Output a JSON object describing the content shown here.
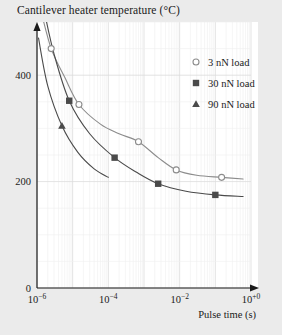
{
  "chart_data": {
    "type": "line",
    "title": "Cantilever heater temperature (°C)",
    "xlabel": "Pulse time (s)",
    "ylabel": "Cantilever heater temperature (°C)",
    "xscale": "log",
    "yscale": "linear",
    "xlim": [
      1e-06,
      1.0
    ],
    "ylim": [
      0,
      500
    ],
    "grid": true,
    "legend_position": "top-right",
    "xticks": [
      {
        "value": 1e-06,
        "label": "10",
        "exp": "−6"
      },
      {
        "value": 0.0001,
        "label": "10",
        "exp": "−4"
      },
      {
        "value": 0.01,
        "label": "10",
        "exp": "−2"
      },
      {
        "value": 1.0,
        "label": "10",
        "exp": "+0"
      }
    ],
    "yticks": [
      {
        "value": 0,
        "label": "0"
      },
      {
        "value": 200,
        "label": "200"
      },
      {
        "value": 400,
        "label": "400"
      }
    ],
    "series": [
      {
        "name": "3 nN load",
        "legend_label": "3 nN load",
        "marker": "open-circle",
        "color": "#8c8c8c",
        "points": [
          {
            "x": 2.5e-06,
            "y": 450
          },
          {
            "x": 1.5e-05,
            "y": 345
          },
          {
            "x": 0.0007,
            "y": 275
          },
          {
            "x": 0.008,
            "y": 222
          },
          {
            "x": 0.15,
            "y": 208
          }
        ],
        "curve": [
          {
            "x": 1.3e-06,
            "y": 520
          },
          {
            "x": 2.5e-06,
            "y": 450
          },
          {
            "x": 6e-06,
            "y": 396
          },
          {
            "x": 1.5e-05,
            "y": 345
          },
          {
            "x": 6e-05,
            "y": 308
          },
          {
            "x": 0.0002,
            "y": 290
          },
          {
            "x": 0.0007,
            "y": 275
          },
          {
            "x": 0.0025,
            "y": 245
          },
          {
            "x": 0.008,
            "y": 222
          },
          {
            "x": 0.03,
            "y": 212
          },
          {
            "x": 0.15,
            "y": 208
          },
          {
            "x": 0.6,
            "y": 205
          }
        ]
      },
      {
        "name": "30 nN load",
        "legend_label": "30 nN load",
        "marker": "filled-square",
        "color": "#4a4a4a",
        "points": [
          {
            "x": 8e-06,
            "y": 352
          },
          {
            "x": 0.00015,
            "y": 245
          },
          {
            "x": 0.0025,
            "y": 196
          },
          {
            "x": 0.1,
            "y": 175
          }
        ],
        "curve": [
          {
            "x": 1.6e-06,
            "y": 520
          },
          {
            "x": 3e-06,
            "y": 440
          },
          {
            "x": 8e-06,
            "y": 352
          },
          {
            "x": 3e-05,
            "y": 290
          },
          {
            "x": 0.00015,
            "y": 245
          },
          {
            "x": 0.0006,
            "y": 218
          },
          {
            "x": 0.0025,
            "y": 196
          },
          {
            "x": 0.015,
            "y": 182
          },
          {
            "x": 0.1,
            "y": 175
          },
          {
            "x": 0.6,
            "y": 172
          }
        ]
      },
      {
        "name": "90 nN load",
        "legend_label": "90 nN load",
        "marker": "filled-triangle",
        "color": "#4a4a4a",
        "points": [
          {
            "x": 5e-06,
            "y": 305
          }
        ],
        "curve": [
          {
            "x": 1.1e-06,
            "y": 470
          },
          {
            "x": 2e-06,
            "y": 380
          },
          {
            "x": 5e-06,
            "y": 305
          },
          {
            "x": 1.4e-05,
            "y": 255
          },
          {
            "x": 4e-05,
            "y": 224
          },
          {
            "x": 0.0001,
            "y": 208
          }
        ]
      }
    ]
  },
  "legend": {
    "entries": [
      {
        "label": "3 nN load",
        "marker": "open-circle",
        "color": "#8c8c8c"
      },
      {
        "label": "30 nN load",
        "marker": "filled-square",
        "color": "#4a4a4a"
      },
      {
        "label": "90 nN load",
        "marker": "filled-triangle",
        "color": "#4a4a4a"
      }
    ]
  },
  "style": {
    "page_background": "#ebebeb",
    "plot_background": "#ffffff",
    "grid_color": "#e3e3e3",
    "axis_color": "#1a1a1a"
  }
}
